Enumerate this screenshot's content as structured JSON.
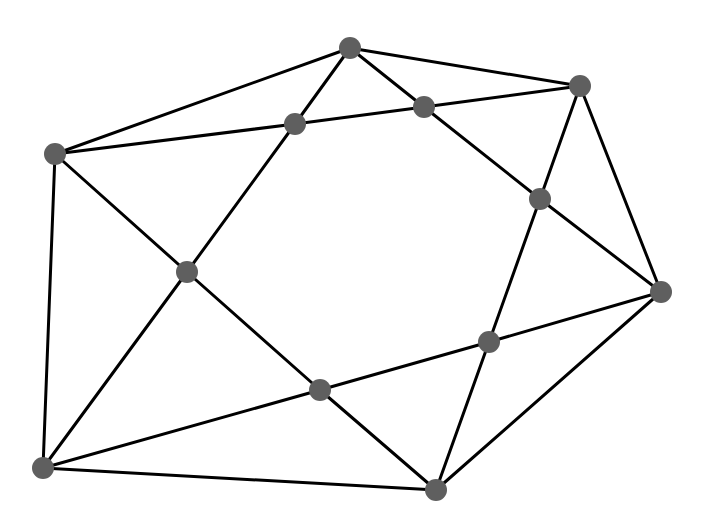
{
  "canvas": {
    "width": 714,
    "height": 522,
    "background": "#ffffff"
  },
  "style": {
    "node_color": "#5f5f5f",
    "node_radius": 11,
    "edge_color": "#000000",
    "edge_width": 3
  },
  "nodes": [
    {
      "id": "A",
      "x": 55,
      "y": 154
    },
    {
      "id": "B",
      "x": 295,
      "y": 124
    },
    {
      "id": "C",
      "x": 350,
      "y": 48
    },
    {
      "id": "D",
      "x": 424,
      "y": 107
    },
    {
      "id": "E",
      "x": 580,
      "y": 86
    },
    {
      "id": "F",
      "x": 540,
      "y": 199
    },
    {
      "id": "G",
      "x": 187,
      "y": 272
    },
    {
      "id": "H",
      "x": 661,
      "y": 292
    },
    {
      "id": "I",
      "x": 489,
      "y": 342
    },
    {
      "id": "J",
      "x": 320,
      "y": 390
    },
    {
      "id": "K",
      "x": 43,
      "y": 468
    },
    {
      "id": "L",
      "x": 436,
      "y": 490
    }
  ],
  "edges": [
    [
      "A",
      "C"
    ],
    [
      "A",
      "B"
    ],
    [
      "A",
      "G"
    ],
    [
      "A",
      "K"
    ],
    [
      "B",
      "C"
    ],
    [
      "B",
      "D"
    ],
    [
      "B",
      "G"
    ],
    [
      "C",
      "D"
    ],
    [
      "C",
      "E"
    ],
    [
      "D",
      "E"
    ],
    [
      "D",
      "F"
    ],
    [
      "E",
      "F"
    ],
    [
      "E",
      "H"
    ],
    [
      "F",
      "H"
    ],
    [
      "F",
      "I"
    ],
    [
      "G",
      "J"
    ],
    [
      "G",
      "K"
    ],
    [
      "H",
      "I"
    ],
    [
      "H",
      "L"
    ],
    [
      "I",
      "J"
    ],
    [
      "I",
      "L"
    ],
    [
      "J",
      "K"
    ],
    [
      "J",
      "L"
    ],
    [
      "K",
      "L"
    ]
  ]
}
